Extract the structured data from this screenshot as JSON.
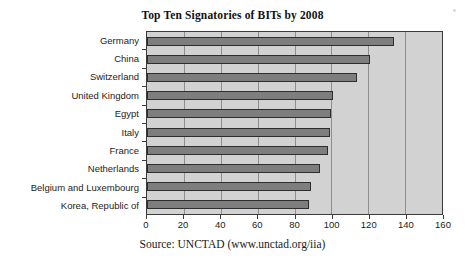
{
  "chart_data": {
    "type": "bar",
    "orientation": "horizontal",
    "title": "Top Ten Signatories of BITs by 2008",
    "xlabel": "",
    "ylabel": "",
    "categories": [
      "Germany",
      "China",
      "Switzerland",
      "United Kingdom",
      "Egypt",
      "Italy",
      "France",
      "Netherlands",
      "Belgium and Luxembourg",
      "Korea, Republic of"
    ],
    "values": [
      134,
      121,
      114,
      101,
      100,
      99,
      98,
      94,
      89,
      88
    ],
    "xlim": [
      0,
      160
    ],
    "xticks": [
      0,
      20,
      40,
      60,
      80,
      100,
      120,
      140,
      160
    ],
    "xtick_labels": [
      "0",
      "20",
      "40",
      "60",
      "80",
      "100",
      "120",
      "140",
      "160"
    ],
    "grid": true,
    "grid_axis": "x",
    "legend": null,
    "plot_background": "#d2d2d2",
    "bar_color": "#7e7e7e",
    "bar_edge_color": "#2e2e2e",
    "gridline_color": "#8e8e8e",
    "axis_color": "#3b3b3b"
  },
  "source_note": "Source: UNCTAD (www.unctad.org/iia)"
}
